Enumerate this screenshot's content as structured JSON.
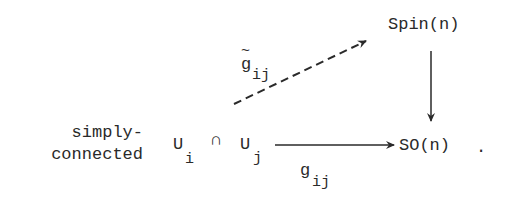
{
  "diagram": {
    "type": "commutative-diagram",
    "nodes": {
      "spin": {
        "label": "Spin(n)"
      },
      "so": {
        "label": "SO(n)",
        "trailing": "."
      },
      "intersection": {
        "u_left": "U",
        "u_left_sub": "i",
        "cap": "∩",
        "u_right": "U",
        "u_right_sub": "j"
      }
    },
    "annotation": {
      "line1": "simply-",
      "line2": "connected"
    },
    "edges": {
      "lift": {
        "from": "intersection",
        "to": "spin",
        "style": "dashed",
        "label_main": "g",
        "label_accent": "~",
        "label_sub": "ij"
      },
      "transition": {
        "from": "intersection",
        "to": "so",
        "style": "solid",
        "label_main": "g",
        "label_sub": "ij"
      },
      "projection": {
        "from": "spin",
        "to": "so",
        "style": "solid"
      }
    },
    "colors": {
      "ink": "#2a2a2a",
      "background": "#ffffff"
    }
  }
}
